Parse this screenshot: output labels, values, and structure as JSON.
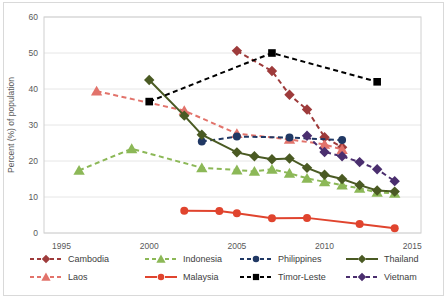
{
  "chart_data": {
    "type": "line",
    "title": "",
    "subtitle": "",
    "xlabel": "",
    "ylabel": "Percent (%) of population",
    "xlim": [
      1994,
      2015.5
    ],
    "ylim": [
      0,
      60
    ],
    "xticks": [
      "1995",
      "2000",
      "2005",
      "2010",
      "2015"
    ],
    "xtick_values": [
      1995,
      2000,
      2005,
      2010,
      2015
    ],
    "yticks": [
      "0",
      "10",
      "20",
      "30",
      "40",
      "50",
      "60"
    ],
    "ytick_values": [
      0,
      10,
      20,
      30,
      40,
      50,
      60
    ],
    "grid": "horizontal",
    "legend_position": "bottom",
    "series": [
      {
        "name": "Cambodia",
        "color": "#9E3B3B",
        "marker": "diamond",
        "dash": "dashed",
        "x": [
          2005,
          2007,
          2008,
          2009,
          2010,
          2011
        ],
        "values": [
          50.6,
          45.0,
          38.4,
          34.3,
          26.6,
          23.8
        ]
      },
      {
        "name": "Indonesia",
        "color": "#8CB857",
        "marker": "triangle",
        "dash": "dashed",
        "x": [
          1996,
          1999,
          2003,
          2005,
          2006,
          2007,
          2008,
          2009,
          2010,
          2011,
          2012,
          2013,
          2014
        ],
        "values": [
          17.4,
          23.4,
          18.1,
          17.5,
          17.1,
          17.7,
          16.6,
          15.2,
          14.2,
          13.3,
          12.4,
          11.3,
          11.0
        ]
      },
      {
        "name": "Laos",
        "color": "#E2736B",
        "marker": "triangle",
        "dash": "dashed",
        "x": [
          1997,
          2002,
          2005,
          2008,
          2010,
          2011
        ],
        "values": [
          39.4,
          34.0,
          27.6,
          26.0,
          24.6,
          23.2
        ]
      },
      {
        "name": "Malaysia",
        "color": "#E0442E",
        "marker": "circle",
        "dash": "solid",
        "x": [
          2002,
          2004,
          2005,
          2007,
          2009,
          2012,
          2014
        ],
        "values": [
          6.2,
          6.1,
          5.5,
          4.1,
          4.2,
          2.5,
          1.3
        ]
      },
      {
        "name": "Philippines",
        "color": "#203864",
        "marker": "circle",
        "dash": "dashed",
        "x": [
          2003,
          2005,
          2008,
          2011
        ],
        "values": [
          25.4,
          26.8,
          26.5,
          25.8
        ]
      },
      {
        "name": "Thailand",
        "color": "#4A5A23",
        "marker": "diamond",
        "dash": "solid",
        "x": [
          2000,
          2002,
          2003,
          2005,
          2006,
          2007,
          2008,
          2009,
          2010,
          2011,
          2012,
          2013,
          2014
        ],
        "values": [
          42.5,
          32.6,
          27.3,
          22.4,
          21.3,
          20.5,
          20.7,
          18.1,
          16.2,
          15.0,
          13.3,
          11.8,
          11.5
        ]
      },
      {
        "name": "Timor-Leste",
        "color": "#000000",
        "marker": "square",
        "dash": "dashed",
        "x": [
          2000,
          2007,
          2013
        ],
        "values": [
          36.5,
          50.0,
          42.0
        ]
      },
      {
        "name": "Vietnam",
        "color": "#4A2E6E",
        "marker": "diamond",
        "dash": "dashed",
        "x": [
          2009,
          2010,
          2011,
          2012,
          2013,
          2014
        ],
        "values": [
          27.0,
          22.5,
          21.3,
          19.7,
          17.7,
          14.4
        ]
      }
    ]
  },
  "legend": {
    "items": [
      {
        "label": "Cambodia",
        "color": "#9E3B3B",
        "marker": "diamond",
        "dash": "dashed"
      },
      {
        "label": "Indonesia",
        "color": "#8CB857",
        "marker": "triangle",
        "dash": "dashed"
      },
      {
        "label": "Laos",
        "color": "#E2736B",
        "marker": "triangle",
        "dash": "dashed"
      },
      {
        "label": "Malaysia",
        "color": "#E0442E",
        "marker": "circle",
        "dash": "solid"
      },
      {
        "label": "Philippines",
        "color": "#203864",
        "marker": "circle",
        "dash": "dashed"
      },
      {
        "label": "Thailand",
        "color": "#4A5A23",
        "marker": "diamond",
        "dash": "solid"
      },
      {
        "label": "Timor-Leste",
        "color": "#000000",
        "marker": "square",
        "dash": "dashed"
      },
      {
        "label": "Vietnam",
        "color": "#4A2E6E",
        "marker": "diamond",
        "dash": "dashed"
      }
    ]
  },
  "axes": {
    "y_title": "Percent (%) of population"
  }
}
